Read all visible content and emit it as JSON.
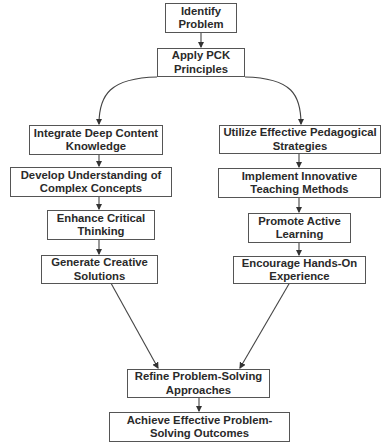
{
  "diagram": {
    "type": "flowchart",
    "nodes": {
      "identify": {
        "label": "Identify Problem"
      },
      "apply": {
        "label": "Apply PCK Principles"
      },
      "integrate": {
        "label": "Integrate Deep Content Knowledge"
      },
      "develop": {
        "label": "Develop Understanding of Complex Concepts"
      },
      "enhance": {
        "label": "Enhance Critical Thinking"
      },
      "generate": {
        "label": "Generate Creative Solutions"
      },
      "utilize": {
        "label": "Utilize Effective Pedagogical Strategies"
      },
      "implement": {
        "label": "Implement Innovative Teaching Methods"
      },
      "promote": {
        "label": "Promote Active Learning"
      },
      "encourage": {
        "label": "Encourage Hands-On Experience"
      },
      "refine": {
        "label": "Refine Problem-Solving Approaches"
      },
      "achieve": {
        "label": "Achieve Effective Problem-Solving Outcomes"
      }
    },
    "edges": [
      [
        "identify",
        "apply"
      ],
      [
        "apply",
        "integrate"
      ],
      [
        "apply",
        "utilize"
      ],
      [
        "integrate",
        "develop"
      ],
      [
        "develop",
        "enhance"
      ],
      [
        "enhance",
        "generate"
      ],
      [
        "utilize",
        "implement"
      ],
      [
        "implement",
        "promote"
      ],
      [
        "promote",
        "encourage"
      ],
      [
        "generate",
        "refine"
      ],
      [
        "encourage",
        "refine"
      ],
      [
        "refine",
        "achieve"
      ]
    ],
    "colors": {
      "stroke": "#555555",
      "text": "#2a2a2a",
      "background": "#ffffff"
    }
  }
}
